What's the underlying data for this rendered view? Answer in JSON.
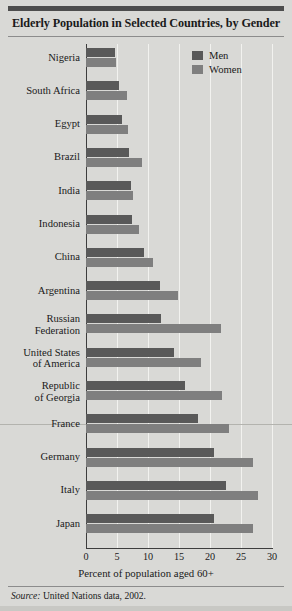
{
  "chart_data": {
    "type": "bar",
    "orientation": "horizontal",
    "title": "Elderly Population in Selected Countries, by Gender",
    "xlabel": "Percent of population aged 60+",
    "ylabel": "",
    "xlim": [
      0,
      30
    ],
    "xticks": [
      0,
      5,
      10,
      15,
      20,
      25,
      30
    ],
    "grid": true,
    "legend_position": "top-right",
    "source": "United Nations data, 2002.",
    "source_prefix": "Source:",
    "categories": [
      "Nigeria",
      "South Africa",
      "Egypt",
      "Brazil",
      "India",
      "Indonesia",
      "China",
      "Argentina",
      "Russian Federation",
      "United States of America",
      "Republic of Georgia",
      "France",
      "Germany",
      "Italy",
      "Japan"
    ],
    "series": [
      {
        "name": "Men",
        "color": "#595959",
        "values": [
          4.6,
          5.3,
          5.8,
          7.0,
          7.2,
          7.4,
          9.4,
          11.9,
          12.1,
          14.2,
          15.9,
          18.0,
          20.6,
          22.5,
          20.6
        ]
      },
      {
        "name": "Women",
        "color": "#7f7f7f",
        "values": [
          4.8,
          6.6,
          6.7,
          9.0,
          7.6,
          8.6,
          10.8,
          14.8,
          21.7,
          18.5,
          21.9,
          23.0,
          27.0,
          27.8,
          27.0
        ]
      }
    ]
  },
  "labels": {
    "tick_0": "0",
    "tick_5": "5",
    "tick_10": "10",
    "tick_15": "15",
    "tick_20": "20",
    "tick_25": "25",
    "tick_30": "30"
  }
}
